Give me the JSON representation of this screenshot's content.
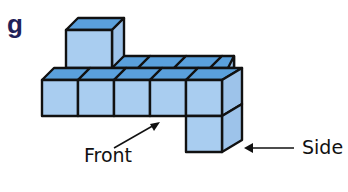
{
  "figure": {
    "label": "g",
    "colors": {
      "front_face": "#a9cdf0",
      "side_face": "#9dc3ea",
      "top_face": "#5aa0dc",
      "edge": "#111111",
      "label": "#1f2158"
    },
    "annotations": {
      "front": "Front",
      "side": "Side"
    },
    "structure": {
      "front_row_cubes": 5,
      "back_row_cubes": 4,
      "top_cube": 1,
      "hanging_cube_below_right": 1
    }
  }
}
